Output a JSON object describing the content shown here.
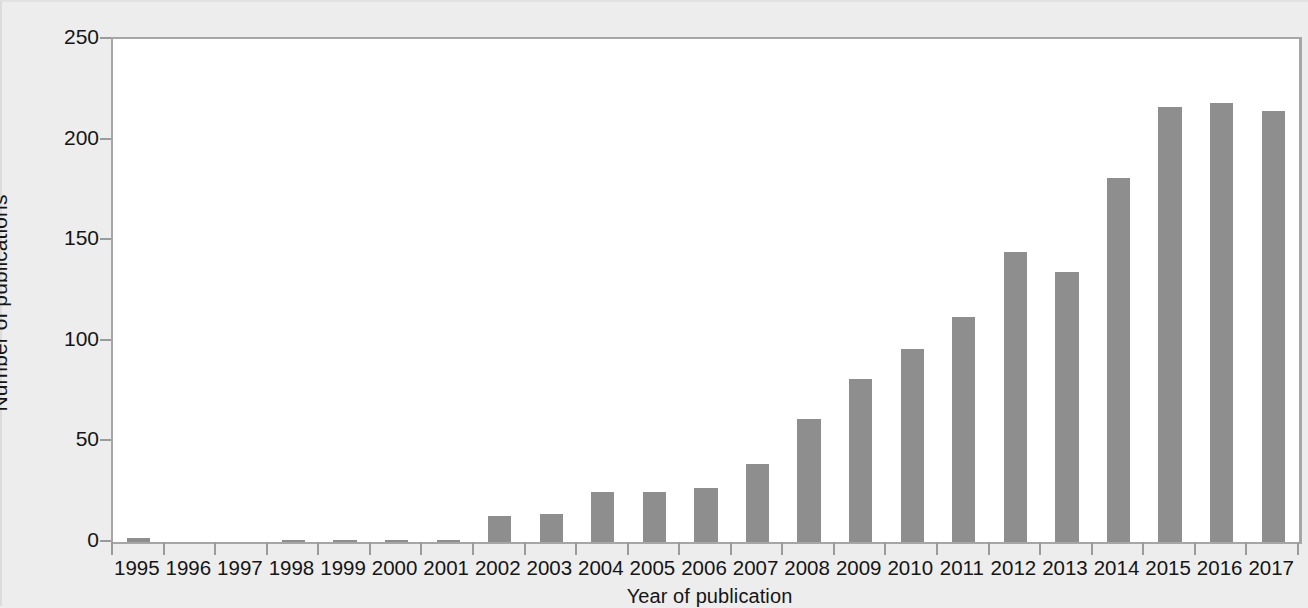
{
  "chart_data": {
    "type": "bar",
    "title": "",
    "xlabel": "Year of publication",
    "ylabel": "Number of publications",
    "categories": [
      "1995",
      "1996",
      "1997",
      "1998",
      "1999",
      "2000",
      "2001",
      "2002",
      "2003",
      "2004",
      "2005",
      "2006",
      "2007",
      "2008",
      "2009",
      "2010",
      "2011",
      "2012",
      "2013",
      "2014",
      "2015",
      "2016",
      "2017"
    ],
    "values": [
      2,
      0,
      0,
      1,
      1,
      1,
      1,
      13,
      14,
      25,
      25,
      27,
      39,
      61,
      81,
      96,
      112,
      144,
      134,
      181,
      216,
      218,
      214
    ],
    "ylim": [
      0,
      250
    ],
    "yticks": [
      0,
      50,
      100,
      150,
      200,
      250
    ],
    "ytick_labels": [
      "0",
      "50",
      "100",
      "150",
      "200",
      "250"
    ],
    "grid": false,
    "legend": null,
    "bar_color": "#8e8e8e",
    "plot_background": "#ffffff",
    "figure_background": "#ededed",
    "axis_color": "#a6a6a6",
    "text_color": "#151515"
  }
}
